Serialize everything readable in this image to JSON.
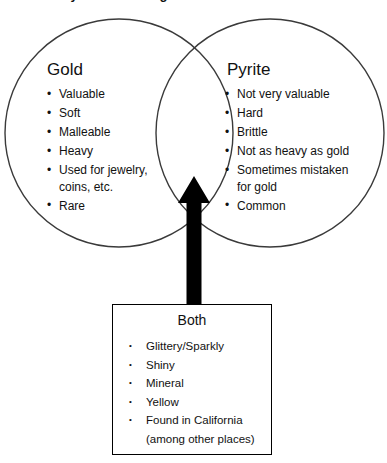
{
  "title_sliver": "Gold and Pyrite Venn Diagram",
  "colors": {
    "circle_stroke": "#3a3a3a",
    "box_stroke": "#000000",
    "arrow_fill": "#000000",
    "text": "#111111",
    "background": "#ffffff"
  },
  "venn": {
    "left_set": {
      "title": "Gold",
      "items": [
        {
          "text": "Valuable"
        },
        {
          "text": "Soft"
        },
        {
          "text": "Malleable"
        },
        {
          "text": "Heavy"
        },
        {
          "text": "Used for jewelry,",
          "continuation": "coins, etc."
        },
        {
          "text": "Rare"
        }
      ]
    },
    "right_set": {
      "title": "Pyrite",
      "items": [
        {
          "text": "Not very valuable"
        },
        {
          "text": "Hard"
        },
        {
          "text": "Brittle"
        },
        {
          "text": "Not as heavy as gold"
        },
        {
          "text": "Sometimes mistaken",
          "continuation": "for gold"
        },
        {
          "text": "Common"
        }
      ]
    },
    "intersection": {
      "title": "Both",
      "items": [
        {
          "text": "Glittery/Sparkly"
        },
        {
          "text": "Shiny"
        },
        {
          "text": "Mineral"
        },
        {
          "text": "Yellow"
        },
        {
          "text": "Found in California",
          "continuation": "(among other places)"
        }
      ]
    }
  },
  "arrow": {
    "label": "points-from-both-box-to-overlap"
  }
}
